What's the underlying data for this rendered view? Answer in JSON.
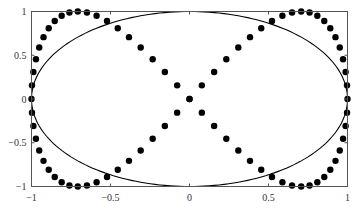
{
  "chart_data": {
    "type": "scatter",
    "title": "",
    "xlabel": "",
    "ylabel": "",
    "xlim": [
      -1,
      1
    ],
    "ylim": [
      -1,
      1
    ],
    "grid": false,
    "legend": null,
    "x_ticks": [
      "-1",
      "-0.5",
      "0",
      "0.5",
      "1"
    ],
    "x_tick_values": [
      -1,
      -0.5,
      0,
      0.5,
      1
    ],
    "y_ticks": [
      "-1",
      "-0.5",
      "0",
      "0.5",
      "1"
    ],
    "y_tick_values": [
      -1,
      -0.5,
      0,
      0.5,
      1
    ],
    "series": [
      {
        "name": "figure-eight (x = cos t, y = sin 2t)",
        "style": "markers",
        "marker": "filled-circle",
        "color": "#000000",
        "x": [
          1,
          0.997,
          0.988,
          0.972,
          0.951,
          0.924,
          0.891,
          0.853,
          0.809,
          0.76,
          0.707,
          0.649,
          0.588,
          0.522,
          0.454,
          0.383,
          0.309,
          0.233,
          0.156,
          0.078,
          0,
          -0.078,
          -0.156,
          -0.233,
          -0.309,
          -0.383,
          -0.454,
          -0.522,
          -0.588,
          -0.649,
          -0.707,
          -0.76,
          -0.809,
          -0.853,
          -0.891,
          -0.924,
          -0.951,
          -0.972,
          -0.988,
          -0.997,
          -1,
          -0.997,
          -0.988,
          -0.972,
          -0.951,
          -0.924,
          -0.891,
          -0.853,
          -0.809,
          -0.76,
          -0.707,
          -0.649,
          -0.588,
          -0.522,
          -0.454,
          -0.383,
          -0.309,
          -0.233,
          -0.156,
          -0.078,
          0,
          0.078,
          0.156,
          0.233,
          0.309,
          0.383,
          0.454,
          0.522,
          0.588,
          0.649,
          0.707,
          0.76,
          0.809,
          0.853,
          0.891,
          0.924,
          0.951,
          0.972,
          0.988,
          0.997
        ],
        "y": [
          0,
          0.156,
          0.309,
          0.454,
          0.588,
          0.707,
          0.809,
          0.891,
          0.951,
          0.988,
          1,
          0.988,
          0.951,
          0.891,
          0.809,
          0.707,
          0.588,
          0.454,
          0.309,
          0.156,
          0,
          -0.156,
          -0.309,
          -0.454,
          -0.588,
          -0.707,
          -0.809,
          -0.891,
          -0.951,
          -0.988,
          -1,
          -0.988,
          -0.951,
          -0.891,
          -0.809,
          -0.707,
          -0.588,
          -0.454,
          -0.309,
          -0.156,
          0,
          0.156,
          0.309,
          0.454,
          0.588,
          0.707,
          0.809,
          0.891,
          0.951,
          0.988,
          1,
          0.988,
          0.951,
          0.891,
          0.809,
          0.707,
          0.588,
          0.454,
          0.309,
          0.156,
          0,
          -0.156,
          -0.309,
          -0.454,
          -0.588,
          -0.707,
          -0.809,
          -0.891,
          -0.951,
          -0.988,
          -1,
          -0.988,
          -0.951,
          -0.891,
          -0.809,
          -0.707,
          -0.588,
          -0.454,
          -0.309,
          -0.156
        ]
      },
      {
        "name": "ellipse (x = cos t, y = sin t)",
        "style": "line",
        "color": "#000000",
        "param": {
          "x": "cos t",
          "y": "sin t",
          "t_range": [
            0,
            6.2832
          ]
        }
      }
    ]
  }
}
